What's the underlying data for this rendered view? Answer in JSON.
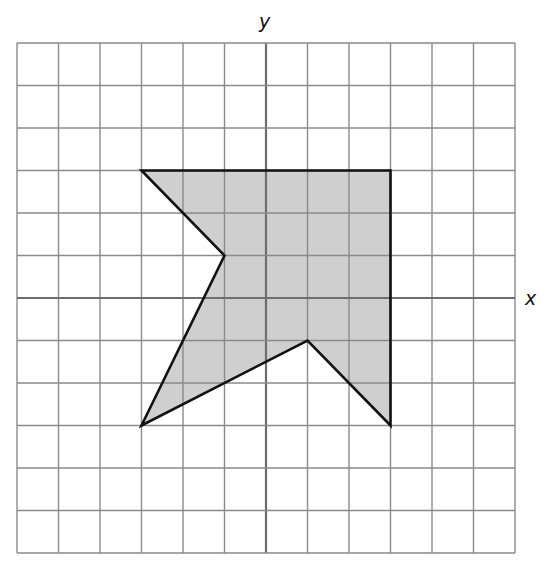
{
  "diagram": {
    "type": "coordinate-grid-polygon",
    "grid": {
      "x_min": -6,
      "x_max": 6,
      "y_min": -6,
      "y_max": 6,
      "step": 1,
      "line_color": "#8a8a8a",
      "axis_color": "#6e6e6e"
    },
    "axes": {
      "x_label": "x",
      "y_label": "y"
    },
    "polygon": {
      "vertices": [
        [
          -3,
          3
        ],
        [
          3,
          3
        ],
        [
          3,
          -3
        ],
        [
          1,
          -1
        ],
        [
          -3,
          -3
        ],
        [
          -1,
          1
        ]
      ],
      "fill": "#cfcfcf",
      "stroke": "#111111"
    }
  }
}
